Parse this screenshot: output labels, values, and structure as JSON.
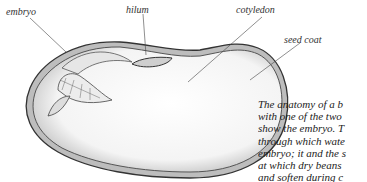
{
  "labels": {
    "embryo": "embryo",
    "hilum": "hilum",
    "cotyledon": "cotyledon",
    "seed_coat": "seed coat"
  },
  "caption": {
    "lines": [
      "The anatomy of a b",
      "with one of the two",
      "show the embryo. T",
      "through which wate",
      "embryo; it and the s",
      "at which dry beans",
      "and soften during c"
    ]
  },
  "colors": {
    "outline": "#444444",
    "shading": "#9a9a9a",
    "text": "#222222"
  }
}
